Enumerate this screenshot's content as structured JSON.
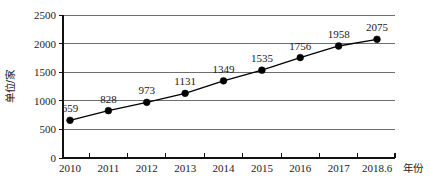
{
  "chart_data": {
    "type": "line",
    "title": "",
    "xlabel": "年份",
    "ylabel": "单位/家",
    "categories": [
      "2010",
      "2011",
      "2012",
      "2013",
      "2014",
      "2015",
      "2016",
      "2017",
      "2018.6"
    ],
    "values": [
      659,
      828,
      973,
      1131,
      1349,
      1535,
      1756,
      1958,
      2075
    ],
    "series": [
      {
        "name": "单位/家",
        "values": [
          659,
          828,
          973,
          1131,
          1349,
          1535,
          1756,
          1958,
          2075
        ]
      }
    ],
    "ylim": [
      0,
      2500
    ],
    "y_ticks": [
      "0",
      "500",
      "1000",
      "1500",
      "2000",
      "2500"
    ],
    "y_tick_values": [
      0,
      500,
      1000,
      1500,
      2000,
      2500
    ],
    "data_labels": [
      "659",
      "828",
      "973",
      "1131",
      "1349",
      "1535",
      "1756",
      "1958",
      "2075"
    ],
    "grid": true,
    "legend": "none",
    "marker": "filled-circle",
    "line_color": "#000000",
    "marker_color": "#000000",
    "grid_color": "#6e6e6e",
    "axis_color": "#111111",
    "background_color": "#ffffff"
  }
}
